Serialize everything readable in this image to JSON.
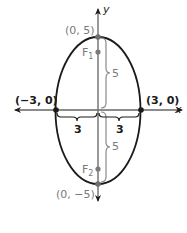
{
  "diagram": {
    "type": "ellipse",
    "colors": {
      "axis": "#1a1a1a",
      "ellipse": "#1a1a1a",
      "gray": "#7a7a7a"
    },
    "axes": {
      "x_label": "x",
      "y_label": "y"
    },
    "vertices": {
      "top": "(0, 5)",
      "bottom": "(0, −5)",
      "left": "(−3, 0)",
      "right": "(3, 0)"
    },
    "foci": {
      "f1_main": "F",
      "f1_sub": "1",
      "f2_main": "F",
      "f2_sub": "2"
    },
    "measurements": {
      "semi_major_top": "5",
      "semi_major_bottom": "5",
      "semi_minor_left": "3",
      "semi_minor_right": "3"
    }
  }
}
